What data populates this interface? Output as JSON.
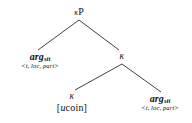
{
  "diagram": {
    "type": "syntactic-tree",
    "nodes": {
      "root": {
        "kappa": "κ",
        "p": "P",
        "full": "κP"
      },
      "left_arg": {
        "head": "arg",
        "subscript": "sit",
        "features": "<t, loc, part>"
      },
      "mid_kappa": {
        "label": "κ"
      },
      "lower_kappa": {
        "label": "κ"
      },
      "lexical_item": {
        "prefix": "[",
        "italic": "u",
        "rest": "coin",
        "suffix": "]",
        "full": "[ucoin]"
      },
      "right_arg": {
        "head": "arg",
        "subscript": "sit",
        "features": "<t, loc, part>"
      }
    },
    "edge_color": "#2b2b2b",
    "background_color": "#ffffff",
    "text_color": "#111111"
  }
}
